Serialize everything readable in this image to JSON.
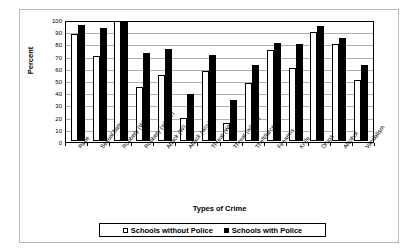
{
  "chart_data": {
    "type": "bar",
    "title": "",
    "xlabel": "Types of Crime",
    "ylabel": "Percent",
    "ylim": [
      0,
      100
    ],
    "yticks": [
      0,
      10,
      20,
      30,
      40,
      50,
      60,
      70,
      80,
      90,
      100
    ],
    "grid": true,
    "legend_position": "bottom",
    "categories": [
      "Rape",
      "Sexual battery",
      "Robbery (W)",
      "Robbery (w/o W)",
      "Attack (W)",
      "Attack (w/o W)",
      "Threat (W)",
      "Threat (w/o W)",
      "Theft/larceny",
      "Firearms",
      "Knife",
      "Drugs",
      "Alcohol",
      "Vandalism"
    ],
    "series": [
      {
        "name": "Schools without Police",
        "color": "#ffffff",
        "values": [
          89,
          71,
          100,
          45,
          55,
          19,
          58,
          15,
          48,
          76,
          61,
          91,
          81,
          51
        ]
      },
      {
        "name": "Schools with Police",
        "color": "#000000",
        "values": [
          97,
          94,
          100,
          73,
          77,
          39,
          72,
          34,
          63,
          82,
          81,
          96,
          86,
          63
        ]
      }
    ]
  },
  "legend": {
    "entries": [
      {
        "label": "Schools without Police",
        "swatch": "hollow-square-icon"
      },
      {
        "label": "Schools with Police",
        "swatch": "filled-square-icon"
      }
    ]
  }
}
